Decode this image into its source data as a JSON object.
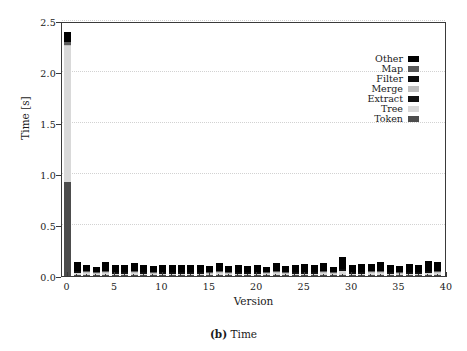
{
  "figure": {
    "caption_prefix": "(b)",
    "caption_text": "Time"
  },
  "chart_data": {
    "type": "bar",
    "subtype": "stacked-bar",
    "title": "",
    "xlabel": "Version",
    "ylabel": "Time [s]",
    "xlim": [
      -0.6,
      40
    ],
    "ylim": [
      0.0,
      2.5
    ],
    "xticks": [
      0,
      5,
      10,
      15,
      20,
      25,
      30,
      35,
      40
    ],
    "xticklabels": [
      "0",
      "5",
      "10",
      "15",
      "20",
      "25",
      "30",
      "35",
      "40"
    ],
    "yticks": [
      0.0,
      0.5,
      1.0,
      1.5,
      2.0,
      2.5
    ],
    "yticklabels": [
      "0.0",
      "0.5",
      "1.0",
      "1.5",
      "2.0",
      "2.5"
    ],
    "grid": "horizontal-dotted",
    "legend_position": "upper-right",
    "categories": [
      0,
      1,
      2,
      3,
      4,
      5,
      6,
      7,
      8,
      9,
      10,
      11,
      12,
      13,
      14,
      15,
      16,
      17,
      18,
      19,
      20,
      21,
      22,
      23,
      24,
      25,
      26,
      27,
      28,
      29,
      30,
      31,
      32,
      33,
      34,
      35,
      36,
      37,
      38,
      39
    ],
    "series": [
      {
        "name": "Token",
        "color": "#4d4d4d",
        "values": [
          0.93,
          0.012,
          0.01,
          0.008,
          0.01,
          0.009,
          0.009,
          0.01,
          0.009,
          0.008,
          0.009,
          0.009,
          0.009,
          0.009,
          0.009,
          0.008,
          0.01,
          0.008,
          0.009,
          0.009,
          0.009,
          0.008,
          0.01,
          0.008,
          0.009,
          0.009,
          0.009,
          0.01,
          0.008,
          0.012,
          0.009,
          0.009,
          0.01,
          0.01,
          0.009,
          0.008,
          0.009,
          0.009,
          0.011,
          0.01
        ]
      },
      {
        "name": "Tree",
        "color": "#d9d9d9",
        "values": [
          1.33,
          0.022,
          0.02,
          0.014,
          0.02,
          0.016,
          0.016,
          0.02,
          0.016,
          0.014,
          0.016,
          0.016,
          0.016,
          0.016,
          0.016,
          0.014,
          0.02,
          0.014,
          0.016,
          0.016,
          0.016,
          0.014,
          0.02,
          0.014,
          0.016,
          0.016,
          0.016,
          0.02,
          0.014,
          0.042,
          0.016,
          0.016,
          0.018,
          0.02,
          0.016,
          0.014,
          0.016,
          0.016,
          0.022,
          0.02
        ]
      },
      {
        "name": "Extract",
        "color": "#111111",
        "values": [
          0.002,
          0.002,
          0.002,
          0.002,
          0.002,
          0.002,
          0.002,
          0.002,
          0.002,
          0.002,
          0.002,
          0.002,
          0.002,
          0.002,
          0.002,
          0.002,
          0.002,
          0.002,
          0.002,
          0.002,
          0.002,
          0.002,
          0.002,
          0.002,
          0.002,
          0.002,
          0.002,
          0.002,
          0.002,
          0.002,
          0.002,
          0.002,
          0.002,
          0.002,
          0.002,
          0.002,
          0.002,
          0.002,
          0.002,
          0.002
        ]
      },
      {
        "name": "Merge",
        "color": "#bfbfbf",
        "values": [
          0.002,
          0.002,
          0.002,
          0.002,
          0.002,
          0.002,
          0.002,
          0.002,
          0.002,
          0.002,
          0.002,
          0.002,
          0.002,
          0.002,
          0.002,
          0.002,
          0.002,
          0.002,
          0.002,
          0.002,
          0.002,
          0.002,
          0.002,
          0.002,
          0.002,
          0.002,
          0.002,
          0.002,
          0.002,
          0.002,
          0.002,
          0.002,
          0.002,
          0.002,
          0.002,
          0.002,
          0.002,
          0.002,
          0.002,
          0.002
        ]
      },
      {
        "name": "Filter",
        "color": "#0d0d0d",
        "values": [
          0.003,
          0.002,
          0.002,
          0.002,
          0.002,
          0.002,
          0.002,
          0.002,
          0.002,
          0.002,
          0.002,
          0.002,
          0.002,
          0.002,
          0.002,
          0.002,
          0.002,
          0.002,
          0.002,
          0.002,
          0.002,
          0.002,
          0.002,
          0.002,
          0.002,
          0.002,
          0.002,
          0.002,
          0.002,
          0.002,
          0.002,
          0.002,
          0.002,
          0.002,
          0.002,
          0.002,
          0.002,
          0.002,
          0.002,
          0.002
        ]
      },
      {
        "name": "Map",
        "color": "#595959",
        "values": [
          0.025,
          0.002,
          0.002,
          0.002,
          0.002,
          0.002,
          0.002,
          0.002,
          0.002,
          0.002,
          0.002,
          0.002,
          0.002,
          0.002,
          0.002,
          0.002,
          0.002,
          0.002,
          0.002,
          0.002,
          0.002,
          0.002,
          0.002,
          0.002,
          0.002,
          0.002,
          0.002,
          0.002,
          0.002,
          0.002,
          0.002,
          0.002,
          0.002,
          0.002,
          0.002,
          0.002,
          0.002,
          0.002,
          0.002,
          0.002
        ]
      },
      {
        "name": "Other",
        "color": "#000000",
        "values": [
          0.098,
          0.1,
          0.074,
          0.062,
          0.095,
          0.074,
          0.077,
          0.094,
          0.072,
          0.072,
          0.075,
          0.073,
          0.078,
          0.076,
          0.08,
          0.072,
          0.09,
          0.064,
          0.078,
          0.07,
          0.072,
          0.062,
          0.088,
          0.066,
          0.074,
          0.086,
          0.074,
          0.086,
          0.062,
          0.124,
          0.074,
          0.082,
          0.086,
          0.1,
          0.076,
          0.066,
          0.086,
          0.072,
          0.11,
          0.096
        ]
      }
    ],
    "totals": [
      2.39,
      0.14,
      0.112,
      0.092,
      0.133,
      0.107,
      0.11,
      0.132,
      0.105,
      0.102,
      0.108,
      0.106,
      0.111,
      0.109,
      0.113,
      0.102,
      0.128,
      0.094,
      0.111,
      0.103,
      0.105,
      0.092,
      0.124,
      0.096,
      0.107,
      0.119,
      0.107,
      0.124,
      0.092,
      0.186,
      0.107,
      0.115,
      0.122,
      0.138,
      0.109,
      0.096,
      0.119,
      0.105,
      0.151,
      0.134
    ]
  },
  "legend": {
    "entries": [
      {
        "label": "Other",
        "color": "#000000"
      },
      {
        "label": "Map",
        "color": "#595959"
      },
      {
        "label": "Filter",
        "color": "#0d0d0d"
      },
      {
        "label": "Merge",
        "color": "#bfbfbf"
      },
      {
        "label": "Extract",
        "color": "#111111"
      },
      {
        "label": "Tree",
        "color": "#d9d9d9"
      },
      {
        "label": "Token",
        "color": "#4d4d4d"
      }
    ]
  }
}
